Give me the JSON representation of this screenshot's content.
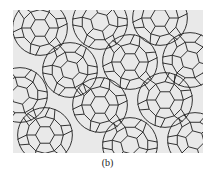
{
  "figure": {
    "caption": "(b)",
    "colors": {
      "background": "#e9e9e9",
      "line": "#1e1e1e",
      "page": "#ffffff"
    },
    "tile_edge": 9.5,
    "rosettes": [
      {
        "x": 27,
        "y": 18,
        "rot": 0
      },
      {
        "x": 87,
        "y": 12,
        "rot": 15
      },
      {
        "x": 147,
        "y": 8,
        "rot": 0
      },
      {
        "x": 57,
        "y": 60,
        "rot": 15
      },
      {
        "x": 117,
        "y": 52,
        "rot": 0
      },
      {
        "x": 177,
        "y": 50,
        "rot": 15
      },
      {
        "x": 7,
        "y": 85,
        "rot": 15
      },
      {
        "x": 87,
        "y": 95,
        "rot": 0
      },
      {
        "x": 152,
        "y": 90,
        "rot": 0
      },
      {
        "x": 32,
        "y": 125,
        "rot": 0
      },
      {
        "x": 117,
        "y": 135,
        "rot": 15
      },
      {
        "x": 182,
        "y": 130,
        "rot": 15
      }
    ]
  }
}
